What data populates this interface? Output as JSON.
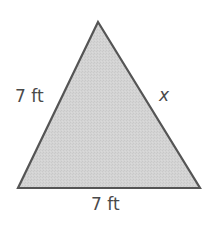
{
  "figure": {
    "shape": "triangle",
    "vertices": {
      "apex": [
        98,
        22
      ],
      "bottom_left": [
        18,
        188
      ],
      "bottom_right": [
        200,
        188
      ]
    },
    "fill_color": "#d3d3d3",
    "stroke_color": "#555555"
  },
  "labels": {
    "left_side": "7 ft",
    "right_side": "x",
    "base": "7 ft"
  }
}
